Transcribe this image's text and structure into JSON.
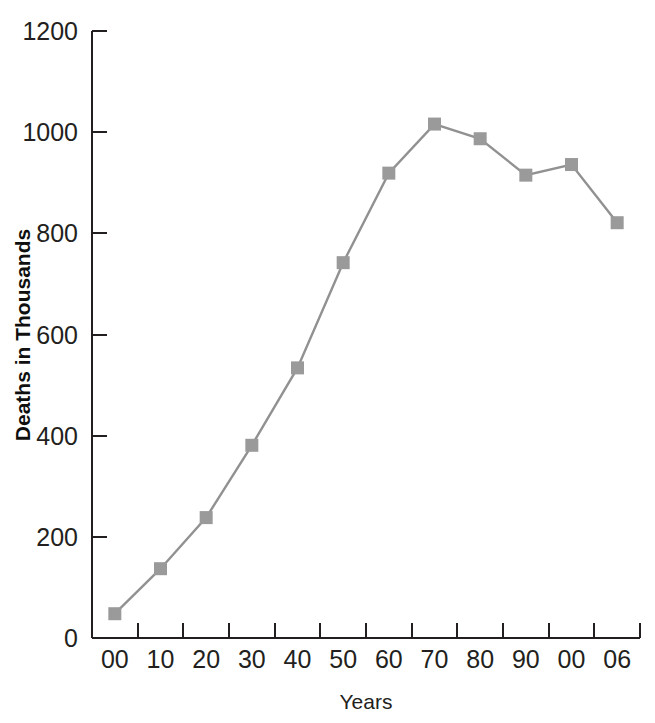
{
  "chart_data": {
    "type": "line",
    "title": "",
    "xlabel": "Years",
    "ylabel": "Deaths in Thousands",
    "categories": [
      "00",
      "10",
      "20",
      "30",
      "40",
      "50",
      "60",
      "70",
      "80",
      "90",
      "00",
      "06"
    ],
    "values": [
      48,
      137,
      238,
      381,
      534,
      742,
      919,
      1016,
      987,
      915,
      936,
      821
    ],
    "series": [
      {
        "name": "Deaths in Thousands",
        "values": [
          48,
          137,
          238,
          381,
          534,
          742,
          919,
          1016,
          987,
          915,
          936,
          821
        ]
      }
    ],
    "ylim": [
      0,
      1200
    ],
    "ytick_labels": [
      "0",
      "200",
      "400",
      "600",
      "800",
      "1000",
      "1200"
    ],
    "ytick_values": [
      0,
      200,
      400,
      600,
      800,
      1000,
      1200
    ],
    "xtick_labels": [
      "00",
      "10",
      "20",
      "30",
      "40",
      "50",
      "60",
      "70",
      "80",
      "90",
      "00",
      "06"
    ],
    "grid": false,
    "legend": "none",
    "marker": "square",
    "colors": {
      "line": "#919191",
      "marker": "#9a9a9a",
      "axis": "#231f20",
      "text": "#231f20",
      "background": "#ffffff"
    }
  }
}
